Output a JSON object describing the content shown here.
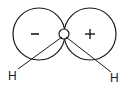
{
  "diagram": {
    "lobes": [
      {
        "name": "left-lobe",
        "sign": "–",
        "cx": 39,
        "cy": 34,
        "r": 26
      },
      {
        "name": "right-lobe",
        "sign": "+",
        "cx": 90,
        "cy": 34,
        "r": 26
      }
    ],
    "center_atom": {
      "cx": 64,
      "cy": 34,
      "r": 5
    },
    "atoms": [
      {
        "name": "hydrogen-left",
        "label": "H",
        "x": 13,
        "y": 77
      },
      {
        "name": "hydrogen-right",
        "label": "H",
        "x": 116,
        "y": 80
      }
    ],
    "colors": {
      "stroke": "#1a1a1a",
      "background": "#ffffff"
    }
  }
}
